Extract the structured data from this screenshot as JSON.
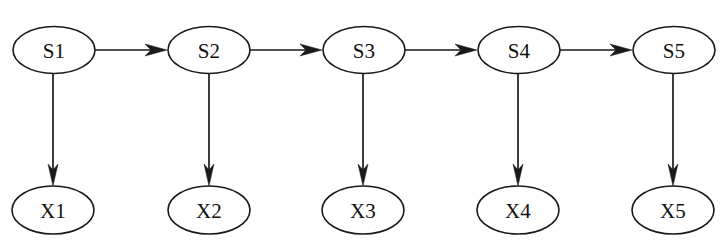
{
  "diagram": {
    "type": "directed-graph",
    "background_color": "#ffffff",
    "stroke_color": "#1a1a1a",
    "label_color": "#111111",
    "canvas": {
      "width": 721,
      "height": 249
    },
    "geometry": {
      "state_row_cy": 50,
      "observation_row_cy": 210,
      "node_rx": 41,
      "node_ry": 23.5
    },
    "state_nodes": [
      {
        "id": "S1",
        "label": "S1",
        "cx": 54,
        "cy": 50
      },
      {
        "id": "S2",
        "label": "S2",
        "cx": 209,
        "cy": 50
      },
      {
        "id": "S3",
        "label": "S3",
        "cx": 364,
        "cy": 50
      },
      {
        "id": "S4",
        "label": "S4",
        "cx": 519,
        "cy": 50
      },
      {
        "id": "S5",
        "label": "S5",
        "cx": 674,
        "cy": 50
      }
    ],
    "observation_nodes": [
      {
        "id": "X1",
        "label": "X1",
        "cx": 53,
        "cy": 210
      },
      {
        "id": "X2",
        "label": "X2",
        "cx": 209,
        "cy": 210
      },
      {
        "id": "X3",
        "label": "X3",
        "cx": 363,
        "cy": 210
      },
      {
        "id": "X4",
        "label": "X4",
        "cx": 518,
        "cy": 210
      },
      {
        "id": "X5",
        "label": "X5",
        "cx": 673,
        "cy": 210
      }
    ],
    "transition_edges": [
      {
        "from": "S1",
        "to": "S2",
        "x1": 95,
        "x2": 168,
        "y": 50
      },
      {
        "from": "S2",
        "to": "S3",
        "x1": 250,
        "x2": 323,
        "y": 50
      },
      {
        "from": "S3",
        "to": "S4",
        "x1": 405,
        "x2": 478,
        "y": 50
      },
      {
        "from": "S4",
        "to": "S5",
        "x1": 560,
        "x2": 633,
        "y": 50
      }
    ],
    "emission_edges": [
      {
        "from": "S1",
        "to": "X1",
        "x": 53,
        "y1": 74,
        "y2": 186
      },
      {
        "from": "S2",
        "to": "X2",
        "x": 209,
        "y1": 74,
        "y2": 186
      },
      {
        "from": "S3",
        "to": "X3",
        "x": 363,
        "y1": 74,
        "y2": 186
      },
      {
        "from": "S4",
        "to": "X4",
        "x": 518,
        "y1": 74,
        "y2": 186
      },
      {
        "from": "S5",
        "to": "X5",
        "x": 673,
        "y1": 74,
        "y2": 186
      }
    ]
  }
}
